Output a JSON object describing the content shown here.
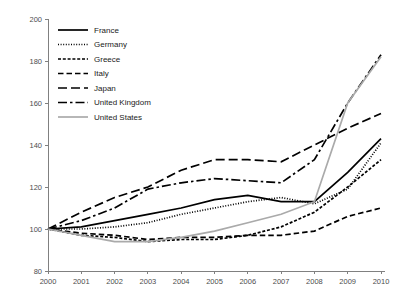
{
  "chart_data": {
    "type": "line",
    "title": "",
    "subtitle": "",
    "xlabel": "",
    "ylabel": "",
    "x": [
      2000,
      2001,
      2002,
      2003,
      2004,
      2005,
      2006,
      2007,
      2008,
      2009,
      2010
    ],
    "xtick_labels": [
      "2000",
      "2001",
      "2002",
      "2003",
      "2004",
      "2005",
      "2006",
      "2007",
      "2008",
      "2009",
      "2010"
    ],
    "ytick_labels": [
      "80",
      "100",
      "120",
      "140",
      "160",
      "180",
      "200"
    ],
    "yticks": [
      80,
      100,
      120,
      140,
      160,
      180,
      200
    ],
    "xlim": [
      2000,
      2010
    ],
    "ylim": [
      80,
      200
    ],
    "grid": false,
    "legend_position": "upper-left",
    "series": [
      {
        "name": "France",
        "style": "solid",
        "color": "#000000",
        "values": [
          100,
          101,
          104,
          107,
          110,
          114,
          116,
          113,
          113,
          127,
          143
        ]
      },
      {
        "name": "Germany",
        "style": "dotted",
        "color": "#000000",
        "values": [
          100,
          100,
          101,
          103,
          107,
          110,
          113,
          115,
          112,
          119,
          141
        ]
      },
      {
        "name": "Greece",
        "style": "dashed-small",
        "color": "#000000",
        "values": [
          100,
          97,
          96,
          94,
          95,
          95,
          97,
          101,
          108,
          120,
          133
        ]
      },
      {
        "name": "Italy",
        "style": "dashed-medium",
        "color": "#000000",
        "values": [
          100,
          98,
          97,
          95,
          96,
          96,
          97,
          97,
          99,
          106,
          110
        ]
      },
      {
        "name": "Japan",
        "style": "dashed-long",
        "color": "#000000",
        "values": [
          100,
          108,
          115,
          120,
          128,
          133,
          133,
          132,
          140,
          148,
          155
        ]
      },
      {
        "name": "United Kingdom",
        "style": "dash-dot",
        "color": "#000000",
        "values": [
          100,
          104,
          110,
          119,
          122,
          124,
          123,
          122,
          133,
          160,
          183
        ]
      },
      {
        "name": "United States",
        "style": "solid",
        "color": "#aaaaaa",
        "values": [
          100,
          97,
          94,
          94,
          96,
          99,
          103,
          107,
          113,
          160,
          182
        ]
      }
    ]
  },
  "legend": {
    "entries": [
      {
        "label": "France"
      },
      {
        "label": "Germany"
      },
      {
        "label": "Greece"
      },
      {
        "label": "Italy"
      },
      {
        "label": "Japan"
      },
      {
        "label": "United Kingdom"
      },
      {
        "label": "United States"
      }
    ]
  },
  "colors": {
    "axis": "#808080",
    "tick_text": "#4d4d4d",
    "series_black": "#000000",
    "series_gray": "#aaaaaa",
    "background": "#ffffff"
  }
}
